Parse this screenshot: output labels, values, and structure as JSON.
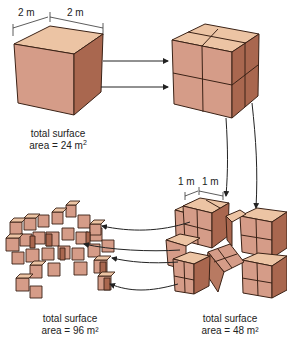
{
  "diagram": {
    "colors": {
      "top_face": "#ecc4a4",
      "front_face": "#d59c88",
      "side_face": "#a9674f",
      "outline": "#3b2216",
      "arrow": "#222222",
      "background": "#ffffff"
    },
    "large_cube": {
      "dimension_labels": [
        "2 m",
        "2 m"
      ],
      "caption_line1": "total surface",
      "caption_line2_prefix": "area = 24 m",
      "caption_line2_sup": "2"
    },
    "split_cube": {
      "description": "2 m cube divided into eight 1 m cubes"
    },
    "medium_pieces": {
      "dimension_labels": [
        "1 m",
        "1 m"
      ],
      "caption_line1": "total surface",
      "caption_line2_partial": "area = 48 m²"
    },
    "small_pieces": {
      "caption_line1": "total surface",
      "caption_line2_partial": "area = 96 m²"
    }
  }
}
